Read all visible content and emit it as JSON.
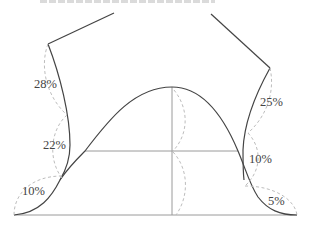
{
  "diagram": {
    "type": "bell-curve-wing-distribution",
    "colors": {
      "curve": "#444444",
      "guide": "#9a9a9a",
      "dashed": "#bdbdbd",
      "text": "#444444"
    },
    "left_wing": {
      "segments": [
        {
          "label": "28%"
        },
        {
          "label": "22%"
        },
        {
          "label": "10%"
        }
      ]
    },
    "right_wing": {
      "segments": [
        {
          "label": "25%"
        },
        {
          "label": "10%"
        },
        {
          "label": "5%"
        }
      ]
    }
  }
}
